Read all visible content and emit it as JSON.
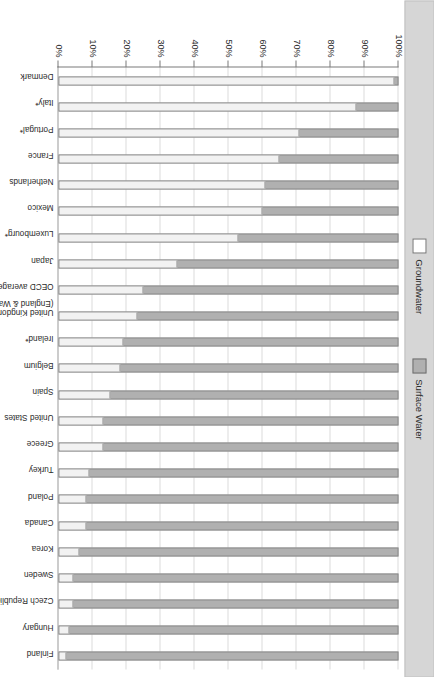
{
  "legend": {
    "position": "top",
    "items": [
      {
        "label": "Groundwater",
        "color": "#ffffff",
        "icon": "legend-swatch-white"
      },
      {
        "label": "Surface Water",
        "color": "#b0b0b0",
        "icon": "legend-swatch-gray"
      }
    ]
  },
  "axis": {
    "value_axis_title": "",
    "category_axis_title": "",
    "ticks": [
      "0%",
      "10%",
      "20%",
      "30%",
      "40%",
      "50%",
      "60%",
      "70%",
      "80%",
      "90%",
      "100%"
    ]
  },
  "chart_data": {
    "type": "bar",
    "orientation": "vertical-stacked-rotated",
    "title": "",
    "subtitle": "",
    "xlabel": "",
    "ylabel": "",
    "ylim": [
      0,
      100
    ],
    "grid": true,
    "legend_position": "top",
    "stacked": true,
    "stack_total": 100,
    "categories": [
      "Denmark",
      "Italy*",
      "Portugal*",
      "France",
      "Netherlands",
      "Mexico",
      "Luxembourg*",
      "Japan",
      "OECD average",
      "United Kingdom\n(England & Wales)",
      "Ireland*",
      "Belgium",
      "Spain",
      "United States",
      "Greece",
      "Turkey",
      "Poland",
      "Canada",
      "Korea",
      "Sweden",
      "Czech Republic",
      "Hungary",
      "Finland"
    ],
    "series": [
      {
        "name": "Groundwater",
        "color": "#f2f2f2",
        "values": [
          99,
          88,
          71,
          65,
          61,
          60,
          53,
          35,
          25,
          23,
          19,
          18,
          15,
          13,
          13,
          9,
          8,
          8,
          6,
          4,
          4,
          3,
          2
        ]
      },
      {
        "name": "Surface Water",
        "color": "#b0b0b0",
        "values": [
          1,
          12,
          29,
          35,
          39,
          40,
          47,
          65,
          75,
          77,
          81,
          82,
          85,
          87,
          87,
          91,
          92,
          92,
          94,
          96,
          96,
          97,
          98
        ]
      }
    ],
    "annotations": []
  }
}
